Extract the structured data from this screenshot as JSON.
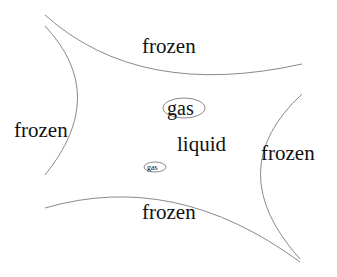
{
  "diagram": {
    "regions": {
      "top": "frozen",
      "left": "frozen",
      "right": "frozen",
      "bottom": "frozen",
      "center": "liquid"
    },
    "bubbles": {
      "large": "gas",
      "small": "gas"
    },
    "colors": {
      "curve": "#8a8a8a",
      "text": "#111111",
      "background": "#ffffff"
    }
  }
}
